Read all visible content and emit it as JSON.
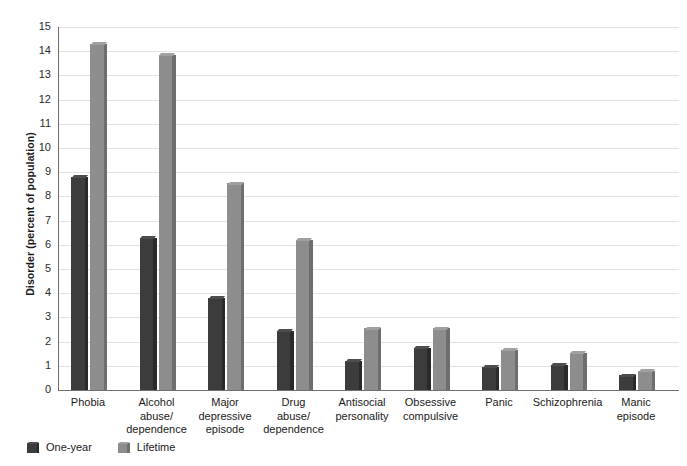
{
  "chart_data": {
    "type": "bar",
    "title": "",
    "xlabel": "",
    "ylabel": "Disorder (percent of population)",
    "ylim": [
      0,
      15
    ],
    "ytick_step": 1,
    "grid": true,
    "legend_position": "bottom-left",
    "categories": [
      "Phobia",
      "Alcohol\nabuse/\ndependence",
      "Major\ndepressive\nepisode",
      "Drug\nabuse/\ndependence",
      "Antisocial\npersonality",
      "Obsessive\ncompulsive",
      "Panic",
      "Schizophrenia",
      "Manic\nepisode"
    ],
    "yticks": [
      "0",
      "1",
      "2",
      "3",
      "4",
      "5",
      "6",
      "7",
      "8",
      "9",
      "10",
      "11",
      "12",
      "13",
      "14",
      "15"
    ],
    "series": [
      {
        "name": "One-year",
        "color": "#3c3c3c",
        "values": [
          8.8,
          6.3,
          3.8,
          2.45,
          1.2,
          1.75,
          0.95,
          1.05,
          0.6
        ]
      },
      {
        "name": "Lifetime",
        "color": "#8d8d8d",
        "values": [
          14.3,
          13.85,
          8.55,
          6.2,
          2.55,
          2.55,
          1.65,
          1.55,
          0.8
        ]
      }
    ]
  },
  "axis": {
    "y_title": "Disorder (percent of population)"
  },
  "legend": {
    "items": [
      {
        "label": "One-year"
      },
      {
        "label": "Lifetime"
      }
    ]
  }
}
